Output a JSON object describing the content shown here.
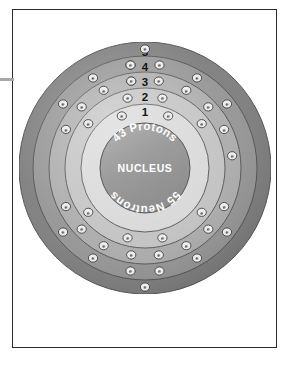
{
  "page": {
    "background_color": "#ffffff",
    "sheet_border_color": "#2b2b2b",
    "left_rule_color": "#a7a7a7"
  },
  "diagram": {
    "center_x": 126,
    "center_y": 126,
    "nucleus": {
      "label": "NUCLEUS",
      "top_arc_text": "43 Protons",
      "bottom_arc_text": "55 Neutrons",
      "protons": 43,
      "neutrons": 55,
      "fill_color": "#9a9a9a",
      "radius": 45
    },
    "electron_symbol": "e",
    "electron_fill": "#ededed",
    "electron_stroke": "#3a3a3a",
    "shells": [
      {
        "number": "1",
        "label_y": 68,
        "radius": 57,
        "band_inner": 50,
        "band_outer": 64,
        "fill_color": "#d8d8d8",
        "electron_count": 2,
        "electron_angles": [
          -24,
          24
        ]
      },
      {
        "number": "2",
        "label_y": 53,
        "radius": 72,
        "band_inner": 64,
        "band_outer": 80,
        "fill_color": "#c2c2c2",
        "electron_count": 8,
        "electron_angles": [
          -14,
          14,
          52,
          128,
          166,
          194,
          232,
          308
        ]
      },
      {
        "number": "3",
        "label_y": 38,
        "radius": 88,
        "band_inner": 80,
        "band_outer": 96,
        "fill_color": "#ababab",
        "electron_count": 18,
        "electron_angles": [
          -9,
          9,
          28,
          46,
          64,
          116,
          134,
          152,
          171,
          189,
          208,
          226,
          244,
          296,
          314,
          332,
          351,
          82
        ]
      },
      {
        "number": "4",
        "label_y": 23,
        "radius": 104,
        "band_inner": 96,
        "band_outer": 112,
        "fill_color": "#949494",
        "electron_count": 13,
        "electron_angles": [
          -8,
          8,
          30,
          52,
          128,
          150,
          172,
          188,
          210,
          232,
          308,
          330,
          352
        ]
      },
      {
        "number": "5",
        "label_y": 8,
        "radius": 120,
        "band_inner": 112,
        "band_outer": 126,
        "fill_color": "#7d7d7d",
        "electron_count": 2,
        "electron_angles": [
          0,
          180
        ]
      }
    ]
  },
  "chart_data": {
    "type": "diagram",
    "nucleus_protons": 43,
    "nucleus_neutrons": 55,
    "shell_labels": [
      "1",
      "2",
      "3",
      "4",
      "5"
    ],
    "shell_electron_counts": [
      2,
      8,
      18,
      13,
      2
    ]
  }
}
